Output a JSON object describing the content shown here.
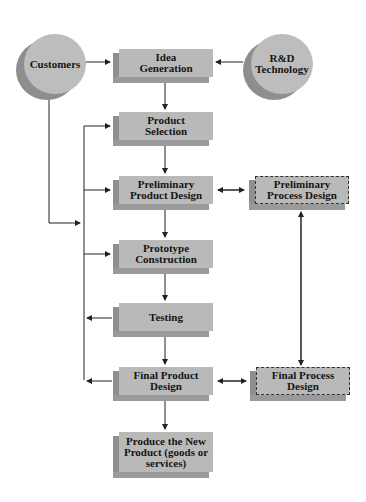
{
  "diagram": {
    "inputs": [
      {
        "id": "customers",
        "label": "Customers"
      },
      {
        "id": "rnd",
        "label": "R&D\nTechnology"
      }
    ],
    "steps": [
      {
        "id": "idea",
        "label": "Idea\nGeneration"
      },
      {
        "id": "selection",
        "label": "Product\nSelection"
      },
      {
        "id": "prelim_product",
        "label": "Preliminary\nProduct Design"
      },
      {
        "id": "prototype",
        "label": "Prototype\nConstruction"
      },
      {
        "id": "testing",
        "label": "Testing"
      },
      {
        "id": "final_product",
        "label": "Final Product\nDesign"
      },
      {
        "id": "produce",
        "label": "Produce the New\nProduct (goods or\nservices)"
      }
    ],
    "process": [
      {
        "id": "prelim_process",
        "label": "Preliminary\nProcess Design"
      },
      {
        "id": "final_process",
        "label": "Final Process\nDesign"
      }
    ],
    "colors": {
      "box_face": "#b9b9b9",
      "box_side": "#8f8f8f",
      "line": "#222222"
    }
  }
}
